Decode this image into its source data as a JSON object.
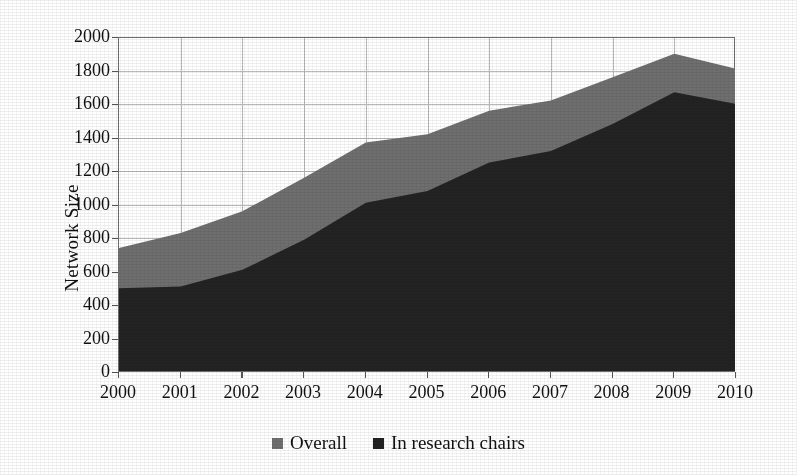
{
  "chart_data": {
    "type": "area",
    "title": "",
    "xlabel": "",
    "ylabel": "Network Size",
    "stacked": false,
    "grid": true,
    "legend_position": "bottom-center",
    "x": [
      2000,
      2001,
      2002,
      2003,
      2004,
      2005,
      2006,
      2007,
      2008,
      2009,
      2010
    ],
    "categories": [
      "2000",
      "2001",
      "2002",
      "2003",
      "2004",
      "2005",
      "2006",
      "2007",
      "2008",
      "2009",
      "2010"
    ],
    "xlim": [
      2000,
      2010
    ],
    "ylim": [
      0,
      2000
    ],
    "yticks": [
      0,
      200,
      400,
      600,
      800,
      1000,
      1200,
      1400,
      1600,
      1800,
      2000
    ],
    "ytick_labels": [
      "0",
      "200",
      "400",
      "600",
      "800",
      "1000",
      "1200",
      "1400",
      "1600",
      "1800",
      "2000"
    ],
    "series": [
      {
        "name": "Overall",
        "color": "#6f6f6f",
        "values": [
          740,
          830,
          960,
          1160,
          1370,
          1420,
          1560,
          1620,
          1760,
          1900,
          1810
        ]
      },
      {
        "name": "In research chairs",
        "color": "#232323",
        "values": [
          500,
          510,
          610,
          790,
          1010,
          1080,
          1250,
          1320,
          1480,
          1670,
          1600
        ]
      }
    ],
    "legend": [
      {
        "label": "Overall",
        "color": "#6f6f6f"
      },
      {
        "label": "In research chairs",
        "color": "#232323"
      }
    ]
  },
  "axis": {
    "y_title": "Network Size"
  }
}
